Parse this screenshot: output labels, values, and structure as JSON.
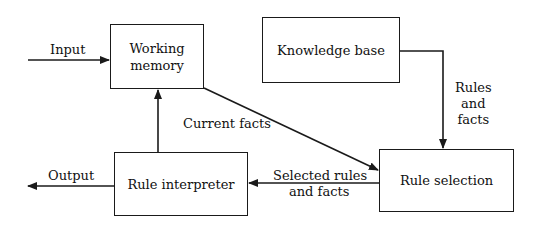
{
  "diagram": {
    "nodes": [
      {
        "id": "working_memory",
        "label_line1": "Working",
        "label_line2": "memory"
      },
      {
        "id": "knowledge_base",
        "label": "Knowledge base"
      },
      {
        "id": "rule_interpreter",
        "label": "Rule interpreter"
      },
      {
        "id": "rule_selection",
        "label": "Rule selection"
      }
    ],
    "edges": {
      "input": "Input",
      "output": "Output",
      "current_facts": "Current facts",
      "rules_and_facts_line1": "Rules",
      "rules_and_facts_line2": "and",
      "rules_and_facts_line3": "facts",
      "selected_line1": "Selected rules",
      "selected_line2": "and facts"
    },
    "line_color": "#1a1a1a"
  }
}
